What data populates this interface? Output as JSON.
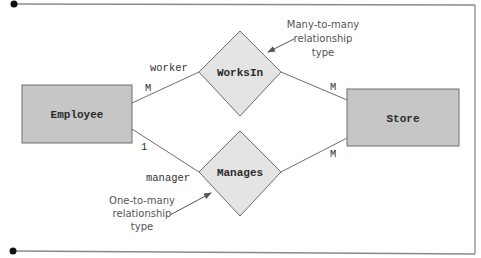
{
  "diagram": {
    "type": "ER diagram",
    "entities": [
      {
        "id": "employee",
        "label": "Employee"
      },
      {
        "id": "store",
        "label": "Store"
      }
    ],
    "relationships": [
      {
        "id": "worksin",
        "label": "WorksIn"
      },
      {
        "id": "manages",
        "label": "Manages"
      }
    ],
    "edges": [
      {
        "from": "employee",
        "to": "worksin",
        "role": "worker",
        "cardinality": "M"
      },
      {
        "from": "worksin",
        "to": "store",
        "role": "",
        "cardinality": "M"
      },
      {
        "from": "employee",
        "to": "manages",
        "role": "manager",
        "cardinality": "1"
      },
      {
        "from": "manages",
        "to": "store",
        "role": "",
        "cardinality": "M"
      }
    ],
    "annotations": [
      {
        "target": "worksin",
        "lines": [
          "Many-to-many",
          "relationship",
          "type"
        ]
      },
      {
        "target": "manages",
        "lines": [
          "One-to-many",
          "relationship",
          "type"
        ]
      }
    ]
  },
  "colors": {
    "entity_fill": "#c6c6c6",
    "relationship_fill": "#e4e4e4",
    "stroke": "#6e6e6e",
    "frame": "#8a8a8a",
    "dot": "#111111"
  }
}
